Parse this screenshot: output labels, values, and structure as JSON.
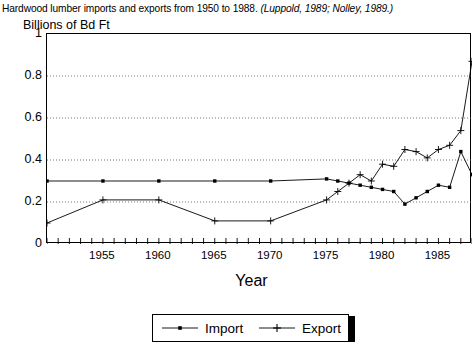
{
  "caption": {
    "main": "Hardwood lumber imports and exports from 1950 to 1988. ",
    "citation": "(Luppold, 1989; Nolley, 1989.)"
  },
  "chart_data": {
    "type": "line",
    "title": "Hardwood lumber imports and exports from 1950 to 1988. (Luppold, 1989; Nolley, 1989.)",
    "xlabel": "Year",
    "ylabel": "Billions of Bd Ft",
    "xlim": [
      1950,
      1988
    ],
    "ylim": [
      0,
      1
    ],
    "ytick_labels": [
      "0",
      "0.2",
      "0.4",
      "0.6",
      "0.8",
      "1"
    ],
    "ytick_values": [
      0,
      0.2,
      0.4,
      0.6,
      0.8,
      1
    ],
    "xtick_labels": [
      "1955",
      "1960",
      "1965",
      "1970",
      "1975",
      "1980",
      "1985"
    ],
    "xtick_values": [
      1955,
      1960,
      1965,
      1970,
      1975,
      1980,
      1985
    ],
    "xtick_minor_step": 1,
    "grid": "horizontal-dotted",
    "legend_position": "bottom",
    "series": [
      {
        "name": "Import",
        "marker": "square-dot",
        "x": [
          1950,
          1955,
          1960,
          1965,
          1970,
          1975,
          1976,
          1977,
          1978,
          1979,
          1980,
          1981,
          1982,
          1983,
          1984,
          1985,
          1986,
          1987,
          1988
        ],
        "values": [
          0.3,
          0.3,
          0.3,
          0.3,
          0.3,
          0.31,
          0.3,
          0.29,
          0.28,
          0.27,
          0.26,
          0.25,
          0.19,
          0.22,
          0.25,
          0.28,
          0.27,
          0.44,
          0.33
        ]
      },
      {
        "name": "Export",
        "marker": "plus",
        "x": [
          1950,
          1955,
          1960,
          1965,
          1970,
          1975,
          1976,
          1977,
          1978,
          1979,
          1980,
          1981,
          1982,
          1983,
          1984,
          1985,
          1986,
          1987,
          1988
        ],
        "values": [
          0.1,
          0.21,
          0.21,
          0.11,
          0.11,
          0.21,
          0.25,
          0.29,
          0.33,
          0.3,
          0.38,
          0.37,
          0.45,
          0.44,
          0.41,
          0.45,
          0.47,
          0.54,
          0.87
        ]
      }
    ]
  },
  "legend": {
    "items": [
      {
        "label": "Import",
        "marker": "square-dot"
      },
      {
        "label": "Export",
        "marker": "plus"
      }
    ]
  }
}
